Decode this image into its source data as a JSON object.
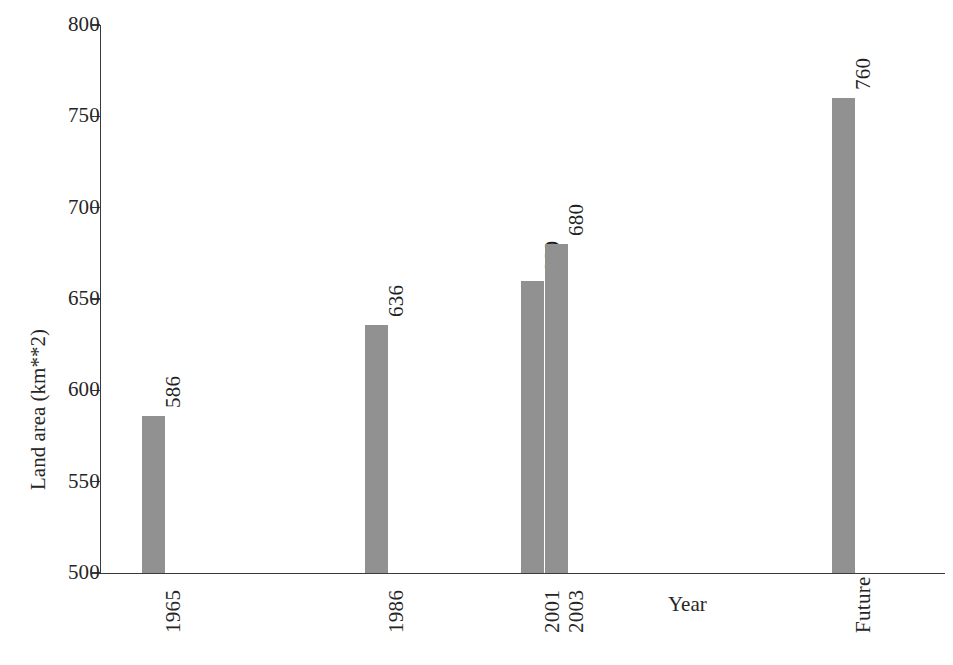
{
  "chart_data": {
    "type": "bar",
    "title": "",
    "xlabel": "Year",
    "ylabel": "Land area (km**2)",
    "categories": [
      "1965",
      "1986",
      "2001",
      "2003",
      "Future"
    ],
    "values": [
      586,
      636,
      660,
      680,
      760
    ],
    "value_labels": [
      "586",
      "636",
      "660",
      "680",
      "760"
    ],
    "ylim": [
      500,
      800
    ],
    "yticks": [
      500,
      550,
      600,
      650,
      700,
      750,
      800
    ],
    "ytick_labels": [
      "500",
      "550",
      "600",
      "650",
      "700",
      "750",
      "800"
    ],
    "grid": false,
    "legend": false,
    "bar_color": "#919191",
    "axis_color": "#3a3a3a",
    "text_color": "#262626",
    "label_rotation": 90,
    "tick_label_rotation": 90
  },
  "axes": {
    "y_title": "Land area (km**2)",
    "x_title": "Year"
  }
}
